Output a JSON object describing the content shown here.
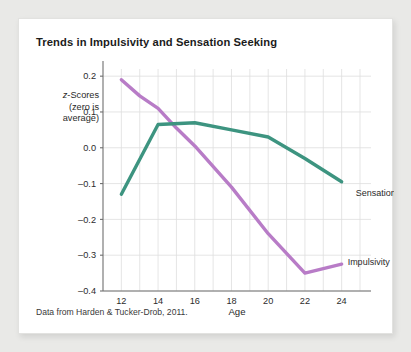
{
  "card": {
    "title": "Trends in Impulsivity and Sensation Seeking",
    "source_note": "Data from Harden & Tucker-Drob, 2011.",
    "background_color": "#ffffff",
    "page_background_color": "#e9e9e7"
  },
  "y_axis_caption": {
    "line1_prefix": "z",
    "line1_rest": "-Scores",
    "line2": "(zero is",
    "line3": "average)"
  },
  "chart_data": {
    "type": "line",
    "title": "Trends in Impulsivity and Sensation Seeking",
    "xlabel": "Age",
    "ylabel": "z-Scores (zero is average)",
    "xlim": [
      11,
      25.6
    ],
    "ylim": [
      -0.4,
      0.22
    ],
    "xticks": [
      12,
      14,
      16,
      18,
      20,
      22,
      24
    ],
    "xtick_labels": [
      "12",
      "14",
      "16",
      "18",
      "20",
      "22",
      "24"
    ],
    "yticks": [
      0.2,
      0.1,
      0.0,
      -0.1,
      -0.2,
      -0.3,
      -0.4
    ],
    "ytick_labels": [
      "0.2",
      "0.1",
      "0.0",
      "–0.1",
      "–0.2",
      "–0.3",
      "–0.4"
    ],
    "grid": true,
    "grid_color": "#dedede",
    "legend_position": "inline-end-of-line",
    "series": [
      {
        "name": "Impulsivity",
        "color": "#b87cc7",
        "label_text": "Impulsivity",
        "x": [
          12,
          13,
          14,
          15,
          16,
          18,
          20,
          22,
          24
        ],
        "values": [
          0.19,
          0.145,
          0.11,
          0.055,
          0.005,
          -0.11,
          -0.24,
          -0.35,
          -0.325
        ]
      },
      {
        "name": "Sensation seeking",
        "color": "#3d9480",
        "label_text": "Sensation seeking",
        "x": [
          12,
          14,
          16,
          18,
          20,
          22,
          24
        ],
        "values": [
          -0.13,
          0.065,
          0.07,
          0.05,
          0.03,
          -0.03,
          -0.095
        ]
      }
    ]
  }
}
